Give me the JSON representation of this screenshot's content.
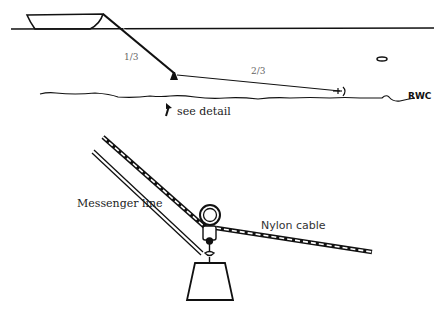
{
  "diagram": {
    "top_view": {
      "labels": {
        "first_segment_fraction": "1/3",
        "second_segment_fraction": "2/3",
        "riverbed_marker": "RWC",
        "callout": "see detail"
      },
      "elements": [
        "boat",
        "water-surface",
        "tether-line",
        "anchor-weight",
        "cable-segment",
        "end-marker",
        "riverbed",
        "fish"
      ]
    },
    "detail_view": {
      "labels": {
        "messenger_line": "Messenger line",
        "nylon_cable": "Nylon cable"
      },
      "elements": [
        "messenger-line",
        "nylon-cable-upper",
        "nylon-cable-lower",
        "pulley-ring",
        "shackle",
        "weight"
      ]
    },
    "colors": {
      "line": "#111111",
      "background": "#ffffff",
      "fraction_text": "#666666"
    }
  }
}
